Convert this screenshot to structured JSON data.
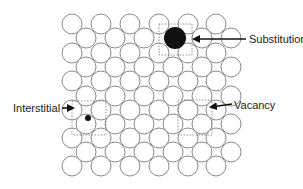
{
  "diagram": {
    "lattice": {
      "rows": 11,
      "row_y": [
        24,
        38,
        53,
        67,
        81,
        96,
        110,
        124,
        138,
        152,
        166
      ],
      "even_row_x": [
        72,
        101,
        130,
        159,
        188,
        216
      ],
      "odd_row_x": [
        86,
        115,
        144,
        173,
        202,
        231
      ],
      "radius": 10,
      "stroke_color": "#8a8a8a"
    },
    "defects": [
      {
        "id": "substitution",
        "label": "Substitution",
        "atom": {
          "cx": 175,
          "cy": 38,
          "r": 11,
          "color": "#111111"
        },
        "box": {
          "x": 159,
          "y": 24,
          "w": 33,
          "h": 31
        },
        "arrow": {
          "x1": 246,
          "y1": 39,
          "x2": 194,
          "y2": 39
        },
        "label_pos": {
          "x": 249,
          "y": 33
        }
      },
      {
        "id": "interstitial",
        "label": "Interstitial",
        "atom": {
          "cx": 88,
          "cy": 118,
          "r": 3,
          "color": "#111111"
        },
        "box": {
          "x": 72,
          "y": 101,
          "w": 34,
          "h": 34
        },
        "arrow": {
          "x1": 62,
          "y1": 108,
          "x2": 73,
          "y2": 108
        },
        "label_pos": {
          "x": 13,
          "y": 102
        }
      },
      {
        "id": "vacancy",
        "label": "Vacancy",
        "missing_atom": {
          "cx": 195,
          "cy": 117
        },
        "box": {
          "x": 178,
          "y": 100,
          "w": 34,
          "h": 35
        },
        "arrow": {
          "x1": 232,
          "y1": 104,
          "x2": 211,
          "y2": 107
        },
        "label_pos": {
          "x": 234,
          "y": 99
        }
      }
    ]
  }
}
